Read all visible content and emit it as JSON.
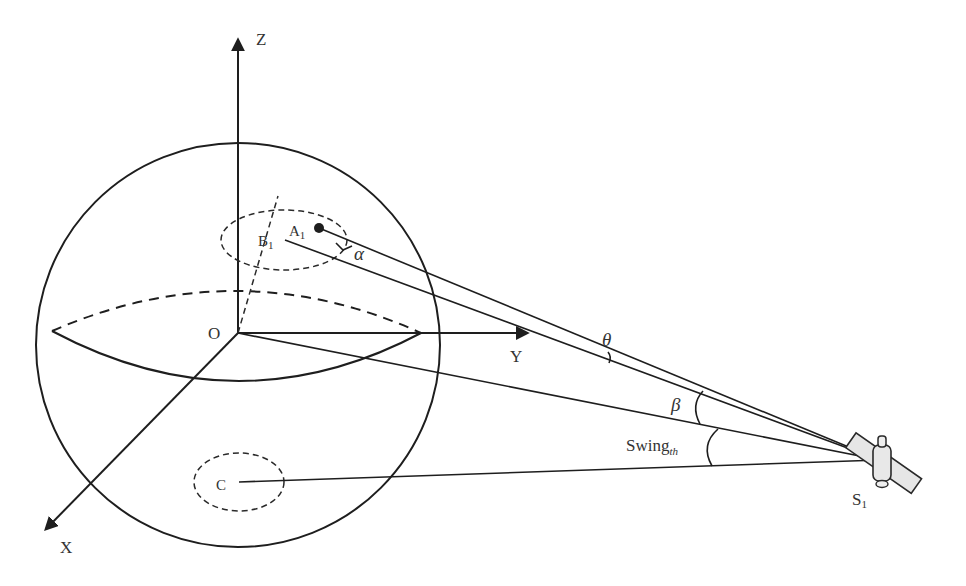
{
  "diagram": {
    "type": "geometry-3d-satellite-observation",
    "axes": {
      "z_label": "Z",
      "y_label": "Y",
      "x_label": "X",
      "origin_label": "O"
    },
    "points": {
      "a1": {
        "label": "A",
        "sub": "1"
      },
      "b1": {
        "label": "B",
        "sub": "1"
      },
      "c": {
        "label": "C"
      },
      "satellite": {
        "label": "S",
        "sub": "1"
      }
    },
    "angles": {
      "alpha": "α",
      "theta": "θ",
      "beta": "β",
      "swing": {
        "label": "Swing",
        "sub": "th"
      }
    },
    "colors": {
      "line": "#1e1e1e",
      "text": "#333333",
      "satellite_fill": "#e6e6e6",
      "background": "#ffffff"
    }
  }
}
